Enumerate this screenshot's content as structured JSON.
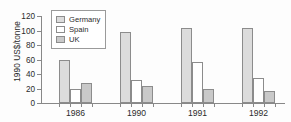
{
  "chart_data": {
    "type": "bar",
    "title": "",
    "xlabel": "",
    "ylabel": "1990 US$/tonne",
    "categories": [
      "1986",
      "1990",
      "1991",
      "1992"
    ],
    "series": [
      {
        "name": "Germany",
        "values": [
          59,
          98,
          103,
          103
        ],
        "color": "#dcdcdc"
      },
      {
        "name": "Spain",
        "values": [
          20,
          32,
          56,
          35
        ],
        "color": "#ffffff"
      },
      {
        "name": "UK",
        "values": [
          28,
          24,
          19,
          16
        ],
        "color": "#c9c9c9"
      }
    ],
    "ylim": [
      0,
      120
    ],
    "yticks": [
      0,
      20,
      40,
      60,
      80,
      100,
      120
    ],
    "grid": false,
    "legend_position": "upper-left-inside"
  }
}
